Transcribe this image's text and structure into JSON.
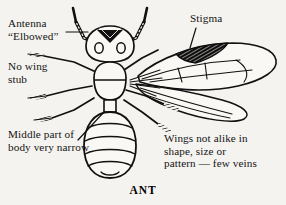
{
  "figure": {
    "caption": "ANT",
    "background_color": "#f5f3ef",
    "ink_color": "#111111"
  },
  "labels": {
    "antenna": "Antenna\n“Elbowed”",
    "no_wing_stub": "No wing\nstub",
    "middle_body": "Middle part of\nbody very narrow",
    "stigma": "Stigma",
    "wings": "Wings not alike in\nshape, size or\npattern — few veins"
  },
  "annotations": [
    {
      "name": "antenna-leader",
      "target": "left antenna base",
      "style": "horizontal line"
    },
    {
      "name": "middle-body-leader",
      "target": "petiole / narrow waist",
      "style": "diagonal line"
    },
    {
      "name": "stigma-leader",
      "target": "dark stigma patch on forewing",
      "style": "short diagonal line"
    }
  ],
  "anatomy": {
    "parts": [
      "antenna-left",
      "antenna-right",
      "head",
      "eye-left",
      "eye-right",
      "mandibles",
      "thorax",
      "petiole",
      "abdomen",
      "leg-left-1",
      "leg-left-2",
      "leg-left-3",
      "leg-right-1",
      "leg-right-2",
      "leg-right-3",
      "forewing",
      "hindwing",
      "stigma-patch"
    ],
    "abdomen_segments": 5,
    "wing_count_visible": 2,
    "leg_count": 6
  }
}
